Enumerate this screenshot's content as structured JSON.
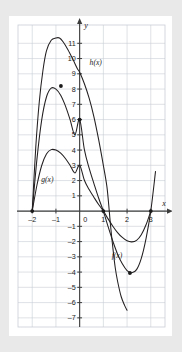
{
  "figure": {
    "background_color": "#e9e9ea",
    "panel_color": "#ffffff",
    "grid_color": "#c8cdd4",
    "axis_color": "#3c3c3c",
    "curve_color": "#231f20"
  },
  "axes": {
    "x_name": "x",
    "y_name": "y",
    "origin_label": "0",
    "x_ticks": [
      {
        "value": -2,
        "label": "–2"
      },
      {
        "value": -1,
        "label": "–1"
      },
      {
        "value": 1,
        "label": "1"
      },
      {
        "value": 2,
        "label": "2"
      },
      {
        "value": 3,
        "label": "3"
      }
    ],
    "y_ticks": [
      {
        "value": 11,
        "label": "11"
      },
      {
        "value": 10,
        "label": "10"
      },
      {
        "value": 9,
        "label": "9"
      },
      {
        "value": 8,
        "label": "8"
      },
      {
        "value": 7,
        "label": "7"
      },
      {
        "value": 6,
        "label": "6"
      },
      {
        "value": 5,
        "label": "5"
      },
      {
        "value": 4,
        "label": "4"
      },
      {
        "value": 3,
        "label": "3"
      },
      {
        "value": 2,
        "label": "2"
      },
      {
        "value": 1,
        "label": "1"
      },
      {
        "value": -1,
        "label": "–1"
      },
      {
        "value": -2,
        "label": "–2"
      },
      {
        "value": -3,
        "label": "–3"
      },
      {
        "value": -4,
        "label": "–4"
      },
      {
        "value": -5,
        "label": "–5"
      },
      {
        "value": -6,
        "label": "–6"
      },
      {
        "value": -7,
        "label": "–7"
      }
    ]
  },
  "curve_labels": {
    "h": "h(x)",
    "g": "g(x)",
    "f": "f(x)"
  },
  "chart_data": {
    "type": "line",
    "title": "",
    "xlabel": "x",
    "ylabel": "y",
    "xlim": [
      -2.6,
      3.6
    ],
    "ylim": [
      -7.6,
      12.2
    ],
    "grid": true,
    "legend": "inline-curve-labels",
    "series": [
      {
        "name": "f(x)",
        "label": "f(x)",
        "label_position": {
          "x": 1.35,
          "y": -3.1
        },
        "roots": [
          -2,
          1,
          3
        ],
        "local_max": {
          "x": -0.79,
          "y": 8.2
        },
        "local_min": {
          "x": 2.12,
          "y": -4.06
        },
        "y_intercept": 6,
        "marked_points": [
          {
            "x": -2,
            "y": 0
          },
          {
            "x": -0.79,
            "y": 8.2
          },
          {
            "x": 0,
            "y": 6
          },
          {
            "x": 1,
            "y": 0
          },
          {
            "x": 2.12,
            "y": -4.06
          },
          {
            "x": 3,
            "y": 0
          }
        ],
        "points": [
          {
            "x": -2.0,
            "y": 0.0
          },
          {
            "x": -1.8,
            "y": 3.42
          },
          {
            "x": -1.6,
            "y": 5.98
          },
          {
            "x": -1.4,
            "y": 7.48
          },
          {
            "x": -1.2,
            "y": 8.06
          },
          {
            "x": -1.0,
            "y": 8.0
          },
          {
            "x": -0.8,
            "y": 7.6
          },
          {
            "x": -0.6,
            "y": 6.9
          },
          {
            "x": -0.4,
            "y": 5.98
          },
          {
            "x": -0.2,
            "y": 5.0
          },
          {
            "x": 0.0,
            "y": 6.0
          },
          {
            "x": 0.2,
            "y": 4.03
          },
          {
            "x": 0.4,
            "y": 2.81
          },
          {
            "x": 0.6,
            "y": 1.82
          },
          {
            "x": 0.8,
            "y": 0.86
          },
          {
            "x": 1.0,
            "y": 0.0
          },
          {
            "x": 1.2,
            "y": -1.02
          },
          {
            "x": 1.4,
            "y": -1.98
          },
          {
            "x": 1.6,
            "y": -2.82
          },
          {
            "x": 1.8,
            "y": -3.46
          },
          {
            "x": 2.0,
            "y": -3.9
          },
          {
            "x": 2.2,
            "y": -4.05
          },
          {
            "x": 2.4,
            "y": -3.84
          },
          {
            "x": 2.6,
            "y": -3.1
          },
          {
            "x": 2.8,
            "y": -1.8
          },
          {
            "x": 3.0,
            "y": 0.0
          },
          {
            "x": 3.2,
            "y": 2.6
          }
        ]
      },
      {
        "name": "g(x)",
        "label": "g(x)",
        "label_position": {
          "x": -1.62,
          "y": 1.92
        },
        "roots": [
          -2,
          1,
          3
        ],
        "local_max": {
          "x": -0.79,
          "y": 4.1
        },
        "local_min": {
          "x": 2.12,
          "y": -2.03
        },
        "y_intercept": 3,
        "marked_points": [],
        "points": [
          {
            "x": -2.0,
            "y": 0.0
          },
          {
            "x": -1.8,
            "y": 1.71
          },
          {
            "x": -1.6,
            "y": 2.99
          },
          {
            "x": -1.4,
            "y": 3.74
          },
          {
            "x": -1.2,
            "y": 4.03
          },
          {
            "x": -1.0,
            "y": 4.0
          },
          {
            "x": -0.8,
            "y": 3.8
          },
          {
            "x": -0.6,
            "y": 3.45
          },
          {
            "x": -0.4,
            "y": 2.99
          },
          {
            "x": -0.2,
            "y": 2.5
          },
          {
            "x": 0.0,
            "y": 3.0
          },
          {
            "x": 0.2,
            "y": 2.02
          },
          {
            "x": 0.4,
            "y": 1.41
          },
          {
            "x": 0.6,
            "y": 0.91
          },
          {
            "x": 0.8,
            "y": 0.43
          },
          {
            "x": 1.0,
            "y": 0.0
          },
          {
            "x": 1.2,
            "y": -0.51
          },
          {
            "x": 1.4,
            "y": -0.99
          },
          {
            "x": 1.6,
            "y": -1.41
          },
          {
            "x": 1.8,
            "y": -1.73
          },
          {
            "x": 2.0,
            "y": -1.95
          },
          {
            "x": 2.2,
            "y": -2.02
          },
          {
            "x": 2.4,
            "y": -1.92
          },
          {
            "x": 2.6,
            "y": -1.55
          },
          {
            "x": 2.8,
            "y": -0.9
          },
          {
            "x": 3.0,
            "y": 0.0
          }
        ]
      },
      {
        "name": "h(x)",
        "label": "h(x)",
        "label_position": {
          "x": 0.42,
          "y": 9.55
        },
        "roots": [
          -2,
          1.25
        ],
        "local_max": {
          "x": -0.85,
          "y": 11.35
        },
        "y_intercept": 9.1,
        "marked_points": [],
        "points": [
          {
            "x": -2.0,
            "y": 0.0
          },
          {
            "x": -1.85,
            "y": 4.2
          },
          {
            "x": -1.7,
            "y": 7.2
          },
          {
            "x": -1.55,
            "y": 9.2
          },
          {
            "x": -1.4,
            "y": 10.5
          },
          {
            "x": -1.2,
            "y": 11.2
          },
          {
            "x": -1.0,
            "y": 11.35
          },
          {
            "x": -0.85,
            "y": 11.35
          },
          {
            "x": -0.7,
            "y": 11.1
          },
          {
            "x": -0.5,
            "y": 10.6
          },
          {
            "x": -0.3,
            "y": 10.0
          },
          {
            "x": -0.1,
            "y": 9.35
          },
          {
            "x": 0.0,
            "y": 9.1
          },
          {
            "x": 0.2,
            "y": 8.35
          },
          {
            "x": 0.4,
            "y": 7.4
          },
          {
            "x": 0.6,
            "y": 6.2
          },
          {
            "x": 0.8,
            "y": 4.7
          },
          {
            "x": 1.0,
            "y": 3.0
          },
          {
            "x": 1.15,
            "y": 1.6
          },
          {
            "x": 1.25,
            "y": 0.0
          },
          {
            "x": 1.3,
            "y": -0.9
          },
          {
            "x": 1.4,
            "y": -2.4
          },
          {
            "x": 1.5,
            "y": -3.7
          },
          {
            "x": 1.6,
            "y": -4.6
          },
          {
            "x": 1.75,
            "y": -5.6
          },
          {
            "x": 1.9,
            "y": -6.2
          },
          {
            "x": 2.0,
            "y": -6.5
          }
        ]
      }
    ]
  }
}
